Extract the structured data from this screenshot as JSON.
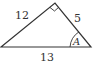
{
  "diagram": {
    "type": "right-triangle",
    "vertices": {
      "left": [
        1,
        47
      ],
      "top": [
        55,
        3
      ],
      "right": [
        91,
        47
      ]
    },
    "right_angle_at": "top",
    "sides": [
      {
        "name": "hypotenuse-base",
        "label": "13"
      },
      {
        "name": "left-leg",
        "label": "12"
      },
      {
        "name": "right-leg",
        "label": "5"
      }
    ],
    "angle": {
      "vertex": "right",
      "label": "A"
    },
    "stroke_color": "#333333",
    "background": "#ffffff"
  }
}
